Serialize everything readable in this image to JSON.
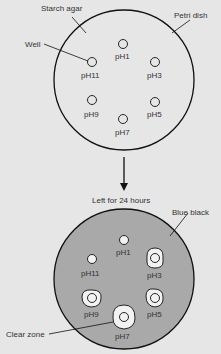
{
  "diagram": {
    "colors": {
      "background": "#e6e6e6",
      "agar_top": "#e6e6e6",
      "agar_bottom": "#a9a9a9",
      "clear_zone": "#f2f2f2",
      "stroke": "#111111"
    },
    "top_dish": {
      "labels": {
        "starch_agar": "Starch agar",
        "petri_dish": "Petri dish",
        "well": "Well"
      },
      "wells": [
        {
          "label": "pH1"
        },
        {
          "label": "pH3"
        },
        {
          "label": "pH5"
        },
        {
          "label": "pH7"
        },
        {
          "label": "pH9"
        },
        {
          "label": "pH11"
        }
      ]
    },
    "transition": {
      "label": "Left for 24 hours"
    },
    "bottom_dish": {
      "labels": {
        "blue_black": "Blue black",
        "clear_zone": "Clear zone"
      },
      "wells": [
        {
          "label": "pH1",
          "clear_zone": false
        },
        {
          "label": "pH3",
          "clear_zone": true
        },
        {
          "label": "pH5",
          "clear_zone": true
        },
        {
          "label": "pH7",
          "clear_zone": true
        },
        {
          "label": "pH9",
          "clear_zone": true
        },
        {
          "label": "pH11",
          "clear_zone": false
        }
      ]
    }
  }
}
